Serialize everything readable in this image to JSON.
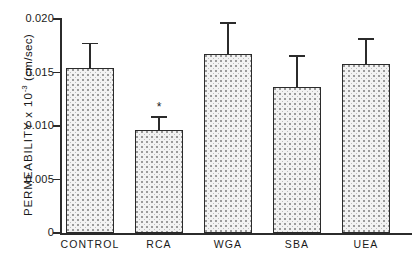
{
  "chart_data": {
    "type": "bar",
    "title": "",
    "xlabel": "",
    "ylabel": "PERMEABILITY x 10",
    "ylabel_exponent": "-3",
    "ylabel_units": "(cm/sec)",
    "categories": [
      "CONTROL",
      "RCA",
      "WGA",
      "SBA",
      "UEA"
    ],
    "values": [
      0.0154,
      0.0096,
      0.0167,
      0.0136,
      0.0158
    ],
    "errors_upper": [
      0.0178,
      0.0109,
      0.0197,
      0.0166,
      0.0182
    ],
    "annotations": [
      {
        "category": "RCA",
        "symbol": "*"
      }
    ],
    "ylim": [
      0,
      0.02
    ],
    "ytick_values": [
      0.02,
      0.015,
      0.01,
      0.005,
      0
    ],
    "ytick_labels": [
      "0.020",
      "0.015",
      "0.010",
      "0.005",
      "0"
    ],
    "grid": false,
    "legend": "none"
  }
}
